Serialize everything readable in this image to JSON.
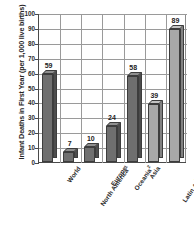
{
  "chart_data": {
    "type": "bar",
    "title": "",
    "xlabel": "",
    "ylabel": "Infant Deaths in First Year (per 1,000 live births)",
    "ylim": [
      0,
      100
    ],
    "ytick_labels": [
      "0",
      "10",
      "20",
      "30",
      "40",
      "50",
      "60",
      "70",
      "80",
      "90",
      "100"
    ],
    "ytick_values": [
      0,
      10,
      20,
      30,
      40,
      50,
      60,
      70,
      80,
      90,
      100
    ],
    "grid": "horizontal-and-vertical",
    "legend": "none",
    "categories": [
      "World",
      "North America",
      "Europe",
      "Oceania",
      "Asia",
      "Latin America\nand the\nCaribbean",
      "Africa"
    ],
    "category_footnotes": [
      "",
      "1",
      "",
      "2",
      "",
      "",
      ""
    ],
    "values": [
      59,
      7,
      10,
      24,
      58,
      39,
      89
    ],
    "value_labels": [
      "59",
      "7",
      "10",
      "24",
      "58",
      "39",
      "89"
    ],
    "bar_colors": [
      "#6f6f6f",
      "#6f6f6f",
      "#6f6f6f",
      "#6f6f6f",
      "#6f6f6f",
      "#a8a8a8",
      "#a8a8a8"
    ],
    "bar_side_colors": [
      "#4d4d4d",
      "#4d4d4d",
      "#4d4d4d",
      "#4d4d4d",
      "#4d4d4d",
      "#828282",
      "#828282"
    ],
    "bar_top_colors": [
      "#8f8f8f",
      "#8f8f8f",
      "#8f8f8f",
      "#8f8f8f",
      "#8f8f8f",
      "#c4c4c4",
      "#c4c4c4"
    ],
    "axis_color": "#4a4a4a",
    "grid_color": "#9a9a9a"
  }
}
